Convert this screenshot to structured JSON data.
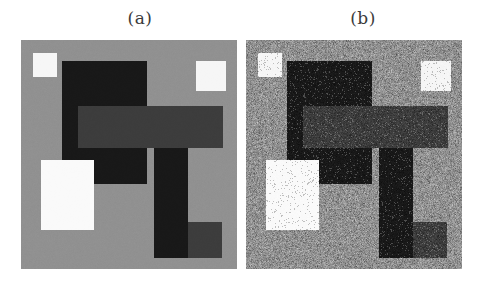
{
  "figure": {
    "type": "image-pair-comparison",
    "panels": [
      {
        "id": "a",
        "label": "(a)",
        "caption_text": "(a)",
        "description": "clean piecewise-constant test image",
        "noise": "none",
        "frame": {
          "x": 21,
          "y": 40,
          "width": 216,
          "height": 229
        },
        "background_color": "#909090",
        "regions": [
          {
            "name": "white-square-top-left",
            "x": 12,
            "y": 13,
            "w": 24,
            "h": 24,
            "color": "#f6f6f6"
          },
          {
            "name": "black-rect-top",
            "x": 41,
            "y": 21,
            "w": 85,
            "h": 66,
            "color": "#181818"
          },
          {
            "name": "white-square-top-right",
            "x": 175,
            "y": 21,
            "w": 30,
            "h": 30,
            "color": "#f6f6f6"
          },
          {
            "name": "black-rect-left-vertical",
            "x": 41,
            "y": 87,
            "w": 24,
            "h": 57,
            "color": "#181818"
          },
          {
            "name": "dark-gray-bar-horizontal",
            "x": 57,
            "y": 66,
            "w": 145,
            "h": 42,
            "color": "#3c3c3c"
          },
          {
            "name": "black-rect-mid",
            "x": 41,
            "y": 108,
            "w": 85,
            "h": 36,
            "color": "#181818"
          },
          {
            "name": "black-bar-vertical-right",
            "x": 133,
            "y": 108,
            "w": 34,
            "h": 110,
            "color": "#181818"
          },
          {
            "name": "white-rect-large-left",
            "x": 20,
            "y": 120,
            "w": 53,
            "h": 70,
            "color": "#fafafa"
          },
          {
            "name": "dark-gray-square-bottom",
            "x": 167,
            "y": 182,
            "w": 34,
            "h": 36,
            "color": "#3c3c3c"
          }
        ]
      },
      {
        "id": "b",
        "label": "(b)",
        "caption_text": "(b)",
        "description": "same image corrupted by additive noise",
        "noise": "gaussian-plus-impulse",
        "frame": {
          "x": 246,
          "y": 40,
          "width": 216,
          "height": 229
        },
        "background_color": "#909090",
        "regions": [
          {
            "name": "white-square-top-left",
            "x": 12,
            "y": 13,
            "w": 24,
            "h": 24,
            "color": "#f6f6f6"
          },
          {
            "name": "black-rect-top",
            "x": 41,
            "y": 21,
            "w": 85,
            "h": 66,
            "color": "#181818"
          },
          {
            "name": "white-square-top-right",
            "x": 175,
            "y": 21,
            "w": 30,
            "h": 30,
            "color": "#f6f6f6"
          },
          {
            "name": "black-rect-left-vertical",
            "x": 41,
            "y": 87,
            "w": 24,
            "h": 57,
            "color": "#181818"
          },
          {
            "name": "dark-gray-bar-horizontal",
            "x": 57,
            "y": 66,
            "w": 145,
            "h": 42,
            "color": "#3c3c3c"
          },
          {
            "name": "black-rect-mid",
            "x": 41,
            "y": 108,
            "w": 85,
            "h": 36,
            "color": "#181818"
          },
          {
            "name": "black-bar-vertical-right",
            "x": 133,
            "y": 108,
            "w": 34,
            "h": 110,
            "color": "#181818"
          },
          {
            "name": "white-rect-large-left",
            "x": 20,
            "y": 120,
            "w": 53,
            "h": 70,
            "color": "#fafafa"
          },
          {
            "name": "dark-gray-square-bottom",
            "x": 167,
            "y": 182,
            "w": 34,
            "h": 36,
            "color": "#3c3c3c"
          }
        ]
      }
    ],
    "palette": {
      "background_gray": "#909090",
      "black": "#181818",
      "dark_gray": "#3c3c3c",
      "white": "#fafafa",
      "page_background": "#ffffff",
      "label_color": "#3b3b3b"
    }
  }
}
